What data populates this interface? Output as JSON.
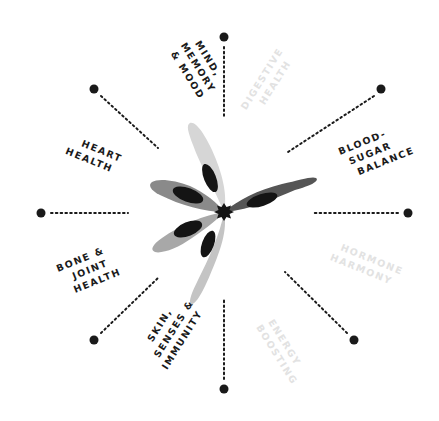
{
  "colors": {
    "background": "#ffffff",
    "active_text": "#1a1a1a",
    "inactive_text": "#e2e2e2",
    "spoke": "#1a1a1a",
    "petal_dark": "#555555",
    "petal_mid": "#8a8a8a",
    "petal_light": "#a8a8a8",
    "petal_lighter": "#c4c4c4",
    "petal_lightest": "#d6d6d6",
    "petal_inner": "#141414",
    "center_star": "#141414"
  },
  "center": {
    "x": 224,
    "y": 212
  },
  "categories": [
    {
      "id": "mind-memory-mood",
      "lines": [
        "MIND,",
        "MEMORY",
        "& MOOD"
      ],
      "active": true
    },
    {
      "id": "digestive-health",
      "lines": [
        "DIGESTIVE",
        "HEALTH"
      ],
      "active": false
    },
    {
      "id": "blood-sugar-balance",
      "lines": [
        "BLOOD-",
        "SUGAR",
        "BALANCE"
      ],
      "active": true
    },
    {
      "id": "hormone-harmony",
      "lines": [
        "HORMONE",
        "HARMONY"
      ],
      "active": false
    },
    {
      "id": "energy-boosting",
      "lines": [
        "ENERGY",
        "BOOSTING"
      ],
      "active": false
    },
    {
      "id": "skin-senses-immunity",
      "lines": [
        "SKIN,",
        "SENSES &",
        "IMMUNITY"
      ],
      "active": true
    },
    {
      "id": "bone-joint-health",
      "lines": [
        "BONE &",
        "JOINT",
        "HEALTH"
      ],
      "active": true
    },
    {
      "id": "heart-health",
      "lines": [
        "HEART",
        "HEALTH"
      ],
      "active": true
    }
  ],
  "spokes": [
    {
      "name": "spoke-top",
      "x1": 224,
      "y1": 47,
      "x2": 224,
      "y2": 118,
      "dx": 224,
      "dy": 37
    },
    {
      "name": "spoke-top-right",
      "x1": 374,
      "y1": 96,
      "x2": 288,
      "y2": 152,
      "dx": 381,
      "dy": 89
    },
    {
      "name": "spoke-right",
      "x1": 398,
      "y1": 213,
      "x2": 312,
      "y2": 213,
      "dx": 408,
      "dy": 213
    },
    {
      "name": "spoke-bottom-right",
      "x1": 347,
      "y1": 333,
      "x2": 285,
      "y2": 272,
      "dx": 354,
      "dy": 340
    },
    {
      "name": "spoke-bottom",
      "x1": 224,
      "y1": 379,
      "x2": 224,
      "y2": 300,
      "dx": 224,
      "dy": 389
    },
    {
      "name": "spoke-bottom-left",
      "x1": 101,
      "y1": 333,
      "x2": 158,
      "y2": 278,
      "dx": 94,
      "dy": 340
    },
    {
      "name": "spoke-left",
      "x1": 51,
      "y1": 213,
      "x2": 128,
      "y2": 213,
      "dx": 41,
      "dy": 213
    },
    {
      "name": "spoke-top-left",
      "x1": 101,
      "y1": 96,
      "x2": 158,
      "y2": 148,
      "dx": 94,
      "dy": 89
    }
  ]
}
